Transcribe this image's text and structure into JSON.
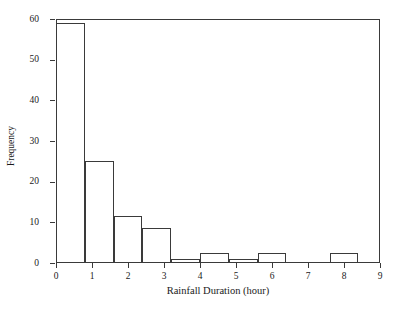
{
  "chart_data": {
    "type": "bar",
    "title": "",
    "subtitle": "",
    "xlabel": "Rainfall Duration (hour)",
    "ylabel": "Frequency",
    "xlim": [
      0,
      9
    ],
    "ylim": [
      0,
      60
    ],
    "xticks": [
      0,
      1,
      2,
      3,
      4,
      5,
      6,
      7,
      8,
      9
    ],
    "yticks": [
      0,
      10,
      20,
      30,
      40,
      50,
      60
    ],
    "grid": false,
    "legend": null,
    "bin_width": 0.8,
    "bin_edges": [
      0.0,
      0.8,
      1.6,
      2.4,
      3.2,
      4.0,
      4.8,
      5.6,
      6.4,
      7.2,
      8.0,
      8.8
    ],
    "bin_centers": [
      0.4,
      1.2,
      2.0,
      2.8,
      3.6,
      4.4,
      5.2,
      6.0,
      6.8,
      7.6,
      8.4
    ],
    "categories": [
      "0.0-0.8",
      "0.8-1.6",
      "1.6-2.4",
      "2.4-3.2",
      "3.2-4.0",
      "4.0-4.8",
      "4.8-5.6",
      "5.6-6.4",
      "6.4-7.2",
      "7.2-8.0",
      "8.0-8.8"
    ],
    "values": [
      59,
      25,
      11.5,
      8.5,
      1,
      2.5,
      1,
      2.5,
      0,
      0,
      2.5
    ],
    "bars": [
      {
        "x0": 0.0,
        "x1": 0.8,
        "value": 59
      },
      {
        "x0": 0.8,
        "x1": 1.6,
        "value": 25
      },
      {
        "x0": 1.6,
        "x1": 2.4,
        "value": 11.5
      },
      {
        "x0": 2.4,
        "x1": 3.2,
        "value": 8.5
      },
      {
        "x0": 3.2,
        "x1": 4.0,
        "value": 1
      },
      {
        "x0": 4.0,
        "x1": 4.8,
        "value": 2.5
      },
      {
        "x0": 4.8,
        "x1": 5.6,
        "value": 1
      },
      {
        "x0": 5.6,
        "x1": 6.4,
        "value": 2.5
      },
      {
        "x0": 7.6,
        "x1": 8.4,
        "value": 2.5
      }
    ],
    "colors": {
      "bar_fill": "#ffffff",
      "bar_edge": "#3a3a3a",
      "axis": "#3a3a3a",
      "text": "#1a1a1a",
      "background": "#ffffff"
    }
  }
}
